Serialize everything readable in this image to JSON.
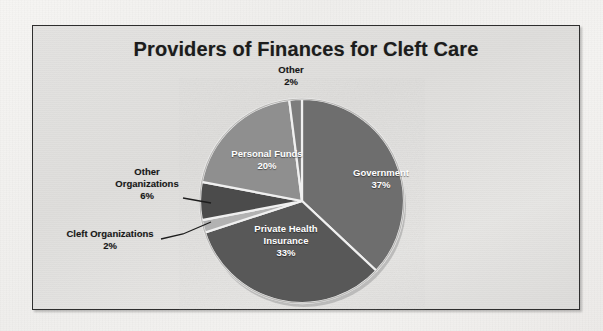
{
  "figure": {
    "title": "Providers of Finances for Cleft Care",
    "background_color": "#f2f1ef",
    "plot_area_color": "#e0dfdd",
    "border_color": "#2e2e2e"
  },
  "chart_data": {
    "type": "pie",
    "title": "Providers of Finances for Cleft Care",
    "xlabel": "",
    "ylabel": "",
    "legend": "none",
    "grid": false,
    "start_angle_deg": 0,
    "direction": "clockwise",
    "categories": [
      "Government",
      "Private Health Insurance",
      "Cleft Organizations",
      "Other Organizations",
      "Personal Funds",
      "Other"
    ],
    "values": [
      37,
      33,
      2,
      6,
      20,
      2
    ],
    "unit": "%",
    "colors": [
      "#6e6e6e",
      "#585858",
      "#b2b2b2",
      "#4b4b4b",
      "#8f8f8f",
      "#7d7d7d"
    ],
    "slice_separator_color": "#f0f0f0",
    "slices": [
      {
        "label": "Government",
        "value": 37,
        "value_text": "37%",
        "color": "#6e6e6e",
        "label_placement": "inside"
      },
      {
        "label": "Private Health Insurance",
        "value": 33,
        "value_text": "33%",
        "color": "#585858",
        "label_placement": "inside"
      },
      {
        "label": "Cleft Organizations",
        "value": 2,
        "value_text": "2%",
        "color": "#b2b2b2",
        "label_placement": "outside"
      },
      {
        "label": "Other Organizations",
        "value": 6,
        "value_text": "6%",
        "color": "#4b4b4b",
        "label_placement": "outside"
      },
      {
        "label": "Personal Funds",
        "value": 20,
        "value_text": "20%",
        "color": "#8f8f8f",
        "label_placement": "inside"
      },
      {
        "label": "Other",
        "value": 2,
        "value_text": "2%",
        "color": "#7d7d7d",
        "label_placement": "outside"
      }
    ]
  },
  "labels": {
    "government": {
      "name": "Government",
      "pct": "37%"
    },
    "private_health_insurance": {
      "name_line1": "Private Health",
      "name_line2": "Insurance",
      "pct": "33%"
    },
    "personal_funds": {
      "name": "Personal Funds",
      "pct": "20%"
    },
    "other_organizations": {
      "name_line1": "Other",
      "name_line2": "Organizations",
      "pct": "6%"
    },
    "cleft_organizations": {
      "name": "Cleft Organizations",
      "pct": "2%"
    },
    "other": {
      "name": "Other",
      "pct": "2%"
    }
  }
}
